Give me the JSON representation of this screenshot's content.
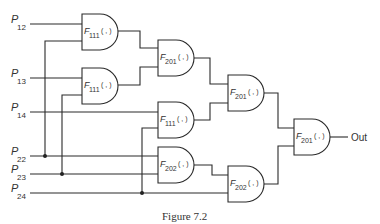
{
  "diagram": {
    "caption": "Figure 7.2",
    "output_label": "Out",
    "inputs": [
      {
        "id": "P12",
        "letter": "P",
        "sub": "12"
      },
      {
        "id": "P13",
        "letter": "P",
        "sub": "13"
      },
      {
        "id": "P14",
        "letter": "P",
        "sub": "14"
      },
      {
        "id": "P22",
        "letter": "P",
        "sub": "22"
      },
      {
        "id": "P23",
        "letter": "P",
        "sub": "23"
      },
      {
        "id": "P24",
        "letter": "P",
        "sub": "24"
      }
    ],
    "gates": [
      {
        "id": "g1",
        "letter": "F",
        "sub": "111",
        "args": "( , )",
        "inputs": [
          "P12",
          "P22"
        ]
      },
      {
        "id": "g2",
        "letter": "F",
        "sub": "111",
        "args": "( , )",
        "inputs": [
          "P13",
          "P23"
        ]
      },
      {
        "id": "g3",
        "letter": "F",
        "sub": "201",
        "args": "( , )",
        "inputs": [
          "g1",
          "g2"
        ]
      },
      {
        "id": "g4",
        "letter": "F",
        "sub": "111",
        "args": "( , )",
        "inputs": [
          "P14",
          "P24"
        ]
      },
      {
        "id": "g5",
        "letter": "F",
        "sub": "202",
        "args": "( , )",
        "inputs": [
          "P22",
          "P23"
        ]
      },
      {
        "id": "g6",
        "letter": "F",
        "sub": "201",
        "args": "( , )",
        "inputs": [
          "g3",
          "g4"
        ]
      },
      {
        "id": "g7",
        "letter": "F",
        "sub": "202",
        "args": "( , )",
        "inputs": [
          "g5",
          "P24"
        ]
      },
      {
        "id": "g8",
        "letter": "F",
        "sub": "201",
        "args": "( , )",
        "inputs": [
          "g6",
          "g7"
        ],
        "output": "Out"
      }
    ]
  }
}
